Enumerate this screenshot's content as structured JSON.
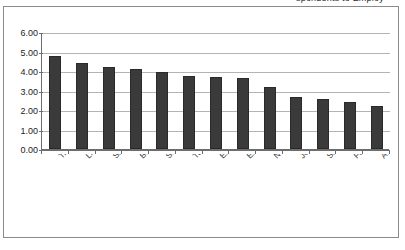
{
  "clipped_title": "spondents to Employ",
  "chart_data": {
    "type": "bar",
    "title": "",
    "subtitle": "",
    "xlabel": "",
    "ylabel": "",
    "categories": [
      "Transportation",
      "Living Expenses",
      "Savings",
      "Books/Supplies",
      "Social/Entertainment",
      "Tuition and Fees",
      "Experience",
      "Education Debt",
      "Non-Education Debt",
      "Job Prior to College",
      "Support Family",
      "Family Demands It",
      "Academic Requirement"
    ],
    "values": [
      4.78,
      4.43,
      4.2,
      4.1,
      3.93,
      3.75,
      3.67,
      3.62,
      3.17,
      2.67,
      2.55,
      2.42,
      2.22
    ],
    "ylim": [
      0.0,
      6.0
    ],
    "ytick_values": [
      0.0,
      1.0,
      2.0,
      3.0,
      4.0,
      5.0,
      6.0
    ],
    "ytick_labels": [
      "0.00",
      "1.00",
      "2.00",
      "3.00",
      "4.00",
      "5.00",
      "6.00"
    ],
    "grid": true,
    "legend": false,
    "legend_position": "none",
    "bar_color": "#3a3a3a",
    "gridline_color": "#b4b4b4",
    "axis_color": "#6d6d6d"
  }
}
